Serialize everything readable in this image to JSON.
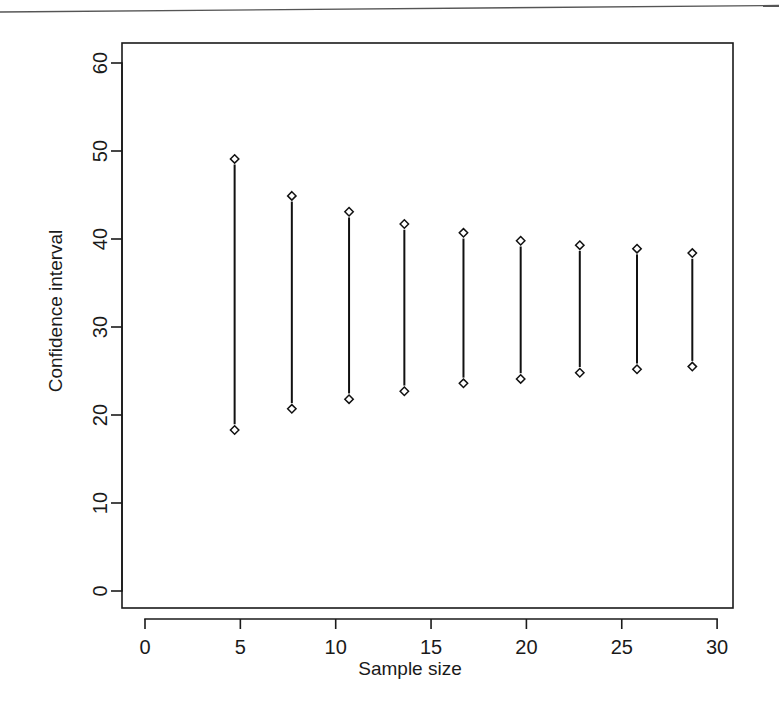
{
  "chart_data": {
    "type": "scatter",
    "title": "",
    "subtitle": "",
    "xlabel": "Sample size",
    "ylabel": "Confidence interval",
    "xlim": [
      0,
      30
    ],
    "ylim": [
      0,
      63
    ],
    "x_ticks": [
      0,
      5,
      10,
      15,
      20,
      25,
      30
    ],
    "x_tick_labels": [
      "0",
      "5",
      "10",
      "15",
      "20",
      "25",
      "30"
    ],
    "y_ticks": [
      0,
      10,
      20,
      30,
      40,
      50,
      60
    ],
    "y_tick_labels": [
      "0",
      "10",
      "20",
      "30",
      "40",
      "50",
      "60"
    ],
    "grid": false,
    "legend": null,
    "legend_position": "none",
    "marker": "open-diamond",
    "series": [
      {
        "name": "Confidence interval",
        "x": [
          4.7,
          7.7,
          10.7,
          13.6,
          16.7,
          19.7,
          22.8,
          25.8,
          28.7
        ],
        "upper": [
          49.1,
          44.9,
          43.1,
          41.7,
          40.7,
          39.8,
          39.3,
          38.9,
          38.4
        ],
        "lower": [
          18.3,
          20.7,
          21.8,
          22.7,
          23.6,
          24.1,
          24.8,
          25.2,
          25.5
        ]
      }
    ]
  },
  "axes": {
    "x_title": "Sample size",
    "y_title": "Confidence interval"
  },
  "colors": {
    "ink": "#1a1a1a",
    "background": "#ffffff"
  }
}
